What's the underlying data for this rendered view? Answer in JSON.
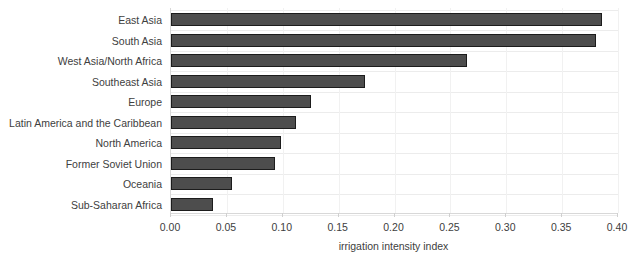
{
  "chart_data": {
    "type": "bar",
    "orientation": "horizontal",
    "title": "",
    "xlabel": "irrigation intensity index",
    "ylabel": "",
    "xlim": [
      0.0,
      0.4
    ],
    "xticks": [
      "0.00",
      "0.05",
      "0.10",
      "0.15",
      "0.20",
      "0.25",
      "0.30",
      "0.35",
      "0.40"
    ],
    "xtick_values": [
      0.0,
      0.05,
      0.1,
      0.15,
      0.2,
      0.25,
      0.3,
      0.35,
      0.4
    ],
    "grid": true,
    "legend": "none",
    "bar_color": "#4d4d4d",
    "bar_edge_color": "#1c1c1c",
    "categories": [
      "East Asia",
      "South Asia",
      "West Asia/North Africa",
      "Southeast Asia",
      "Europe",
      "Latin America and the Caribbean",
      "North America",
      "Former Soviet Union",
      "Oceania",
      "Sub-Saharan Africa"
    ],
    "values": [
      0.386,
      0.38,
      0.265,
      0.174,
      0.125,
      0.112,
      0.098,
      0.093,
      0.055,
      0.038
    ]
  }
}
